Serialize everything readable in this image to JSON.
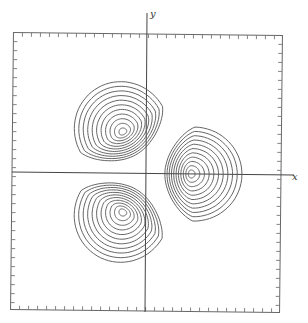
{
  "figure": {
    "type": "contour-plot",
    "axes": {
      "x_label": "x",
      "y_label": "y"
    },
    "frame": {
      "ticks_per_side": 30,
      "tick_direction": "inward"
    },
    "lobes": [
      {
        "name": "upper-left",
        "angle_deg": 120,
        "center": [
          123,
          132
        ],
        "contours": 11
      },
      {
        "name": "right",
        "angle_deg": 0,
        "center": [
          191,
          174
        ],
        "contours": 11
      },
      {
        "name": "lower-left",
        "angle_deg": 240,
        "center": [
          123,
          212
        ],
        "contours": 11
      }
    ],
    "colors": {
      "background": "#ffffff",
      "lines": "#555555"
    }
  }
}
